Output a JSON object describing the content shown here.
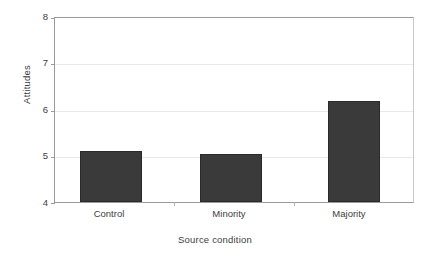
{
  "chart_data": {
    "type": "bar",
    "title": "",
    "categories": [
      "Control",
      "Minority",
      "Majority"
    ],
    "values": [
      5.1,
      5.05,
      6.2
    ],
    "xlabel": "Source condition",
    "ylabel": "Attitudes",
    "ylim": [
      4,
      8
    ],
    "yticks": [
      4,
      5,
      6,
      7,
      8
    ],
    "ytick_labels": [
      "4",
      "5",
      "6",
      "7",
      "8"
    ],
    "grid": true,
    "grid_axis": "y",
    "legend": false,
    "bar_color": "#3a3a3a",
    "bar_edge_color": "#2a2a2a",
    "axis_color": "#9a9a9a",
    "grid_color": "#e9e9e9",
    "background_color": "#ffffff",
    "text_color": "#3d3d3d"
  },
  "axes": {
    "y_title": "Attitudes",
    "x_title": "Source condition",
    "y_tick_0": "4",
    "y_tick_1": "5",
    "y_tick_2": "6",
    "y_tick_3": "7",
    "y_tick_4": "8",
    "x_tick_0": "Control",
    "x_tick_1": "Minority",
    "x_tick_2": "Majority"
  }
}
